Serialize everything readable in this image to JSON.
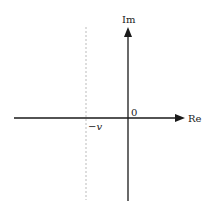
{
  "diagram": {
    "type": "complex-plane",
    "axes": {
      "horizontal_label": "Re",
      "vertical_label": "Im",
      "origin_label": "0"
    },
    "dashed_line": {
      "label_minus": "−",
      "label_var": "v",
      "orientation": "vertical"
    },
    "colors": {
      "axis": "#1a1a1a",
      "dashed": "#bbbbbb",
      "background": "#ffffff"
    }
  }
}
